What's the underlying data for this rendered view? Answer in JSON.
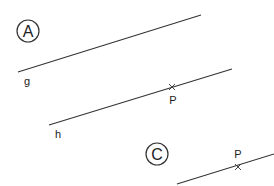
{
  "panels": {
    "a": {
      "label": "A",
      "line_label": "g",
      "line2_label": "h",
      "point_label": "P"
    },
    "c": {
      "label": "C",
      "point_label": "P"
    }
  },
  "colors": {
    "stroke": "#333333",
    "background": "#ffffff"
  }
}
